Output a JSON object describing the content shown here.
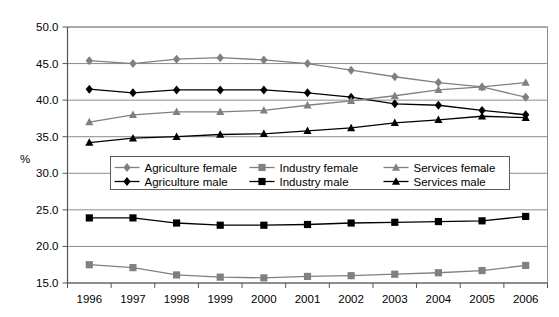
{
  "chart_data": {
    "type": "line",
    "title": "",
    "subtitle": "",
    "xlabel": "",
    "ylabel": "%",
    "categories": [
      "1996",
      "1997",
      "1998",
      "1999",
      "2000",
      "2001",
      "2002",
      "2003",
      "2004",
      "2005",
      "2006"
    ],
    "x": [
      1996,
      1997,
      1998,
      1999,
      2000,
      2001,
      2002,
      2003,
      2004,
      2005,
      2006
    ],
    "ylim": [
      15.0,
      50.0
    ],
    "ytick_labels": [
      "50.0",
      "45.0",
      "40.0",
      "35.0",
      "30.0",
      "25.0",
      "20.0",
      "15.0"
    ],
    "yticks": [
      50.0,
      45.0,
      40.0,
      35.0,
      30.0,
      25.0,
      20.0,
      15.0
    ],
    "grid": true,
    "grid_axis": "y",
    "legend_position": "inside-center-left",
    "legend_columns": 3,
    "series": [
      {
        "name": "Agriculture female",
        "color": "#808080",
        "marker": "diamond",
        "values": [
          45.4,
          45.0,
          45.6,
          45.8,
          45.5,
          45.0,
          44.1,
          43.2,
          42.4,
          41.8,
          40.4
        ]
      },
      {
        "name": "Agriculture male",
        "color": "#000000",
        "marker": "diamond",
        "values": [
          41.5,
          41.0,
          41.4,
          41.4,
          41.4,
          41.0,
          40.4,
          39.5,
          39.3,
          38.6,
          38.0
        ]
      },
      {
        "name": "Industry female",
        "color": "#808080",
        "marker": "square",
        "values": [
          17.5,
          17.1,
          16.1,
          15.8,
          15.7,
          15.9,
          16.0,
          16.2,
          16.4,
          16.7,
          17.4
        ]
      },
      {
        "name": "Industry male",
        "color": "#000000",
        "marker": "square",
        "values": [
          23.9,
          23.9,
          23.2,
          22.9,
          22.9,
          23.0,
          23.2,
          23.3,
          23.4,
          23.5,
          24.1
        ]
      },
      {
        "name": "Services female",
        "color": "#808080",
        "marker": "triangle",
        "values": [
          37.0,
          38.0,
          38.4,
          38.4,
          38.6,
          39.3,
          39.9,
          40.6,
          41.4,
          41.8,
          42.4
        ]
      },
      {
        "name": "Services male",
        "color": "#000000",
        "marker": "triangle",
        "values": [
          34.2,
          34.8,
          35.0,
          35.3,
          35.4,
          35.8,
          36.2,
          36.9,
          37.3,
          37.8,
          37.6
        ]
      }
    ],
    "legend_entries": [
      "Agriculture female",
      "Industry female",
      "Services female",
      "Agriculture male",
      "Industry male",
      "Services male"
    ]
  }
}
